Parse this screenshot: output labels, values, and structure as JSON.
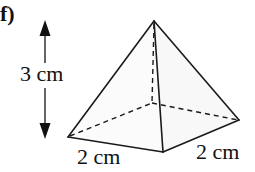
{
  "figure": {
    "part_label": "f)",
    "shape": "square-based pyramid",
    "dimensions": {
      "height_label": "3 cm",
      "base_front_label": "2 cm",
      "base_right_label": "2 cm"
    },
    "colors": {
      "line": "#1a1a1a",
      "face_fill": "#fbfbfb",
      "background": "#ffffff"
    },
    "vertices": {
      "apex": [
        154,
        21
      ],
      "base_left": [
        68,
        137
      ],
      "base_front": [
        163,
        152
      ],
      "base_right": [
        239,
        120
      ],
      "base_back_hidden": [
        152,
        103
      ]
    },
    "height_arrow": {
      "x": 45,
      "top": 20,
      "bottom": 139
    }
  }
}
